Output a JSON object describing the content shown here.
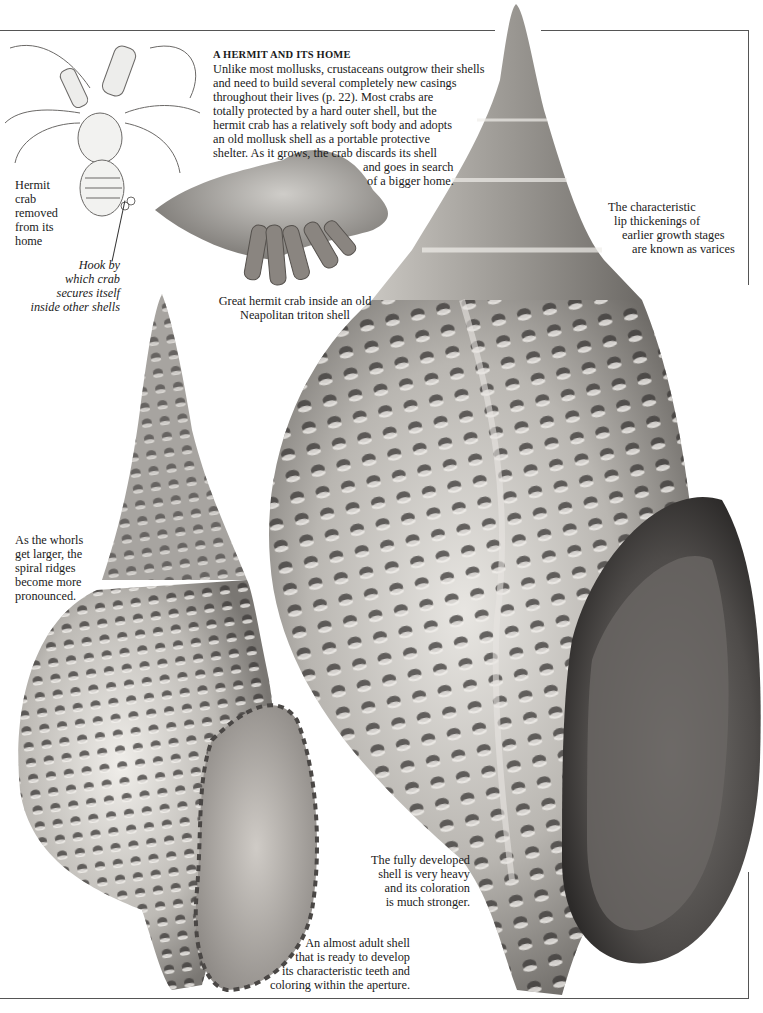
{
  "page": {
    "intro": {
      "title": "A HERMIT AND ITS HOME",
      "lines": [
        "Unlike most mollusks, crustaceans outgrow their shells",
        "and need to build several completely new casings",
        "throughout their lives (p. 22). Most crabs are",
        "totally protected by a hard outer shell, but the",
        "hermit crab has a relatively soft body and adopts",
        "an old mollusk shell as a portable protective",
        "shelter. As it grows, the crab discards its shell",
        "and goes in search",
        "of a bigger home."
      ]
    },
    "captions": {
      "hermit_removed": [
        "Hermit",
        "crab",
        "removed",
        "from its",
        "home"
      ],
      "hook": [
        "Hook by",
        "which crab",
        "secures itself",
        "inside other shells"
      ],
      "great_hermit": [
        "Great hermit crab inside an old",
        "Neapolitan triton shell"
      ],
      "varices": [
        "The characteristic",
        "lip thickenings of",
        "earlier growth stages",
        "are known as varices"
      ],
      "whorls": [
        "As the whorls",
        "get larger, the",
        "spiral ridges",
        "become more",
        "pronounced."
      ],
      "fully_developed": [
        "The fully developed",
        "shell is very heavy",
        "and its coloration",
        "is much stronger."
      ],
      "almost_adult": [
        "An almost adult shell",
        "that is ready to develop",
        "its characteristic teeth and",
        "coloring within the aperture."
      ]
    },
    "illustrations": {
      "hermit_crab_drawing": "hermit-crab-line-drawing",
      "hermit_in_shell_photo": "great-hermit-crab-in-triton-shell",
      "small_triton_shell": "almost-adult-triton-shell",
      "large_triton_shell": "fully-developed-triton-shell"
    },
    "colors": {
      "background": "#ffffff",
      "text": "#1a1a1a",
      "frame": "#555555",
      "shell_light": "#e6e4e0",
      "shell_mid": "#a9a6a2",
      "shell_dark": "#3c3a38"
    }
  }
}
